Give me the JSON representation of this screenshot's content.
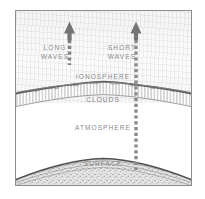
{
  "figure": {
    "frame_color": "#8d8d8d",
    "label_color": "#8a8a8a",
    "ink_color": "#6f6f6f",
    "layers": [
      {
        "name": "ionosphere",
        "label": "IONOSPHERE"
      },
      {
        "name": "clouds",
        "label": "CLOUDS"
      },
      {
        "name": "atmosphere",
        "label": "ATMOSPHERE"
      },
      {
        "name": "surface",
        "label": "SURFACE"
      }
    ],
    "rays": [
      {
        "name": "long-waves",
        "label_line1": "LONG",
        "label_line2": "WAVES",
        "direction": "up",
        "style": "dashed",
        "stops_at": "ionosphere"
      },
      {
        "name": "short-waves",
        "label_line1": "SHORT",
        "label_line2": "WAVES",
        "direction": "up",
        "style": "dashed",
        "stops_at": "surface"
      }
    ]
  },
  "labels": {
    "long_waves_1": "LONG",
    "long_waves_2": "WAVES",
    "short_waves_1": "SHORT",
    "short_waves_2": "WAVES",
    "ionosphere": "IONOSPHERE",
    "clouds": "CLOUDS",
    "atmosphere": "ATMOSPHERE",
    "surface": "SURFACE"
  }
}
